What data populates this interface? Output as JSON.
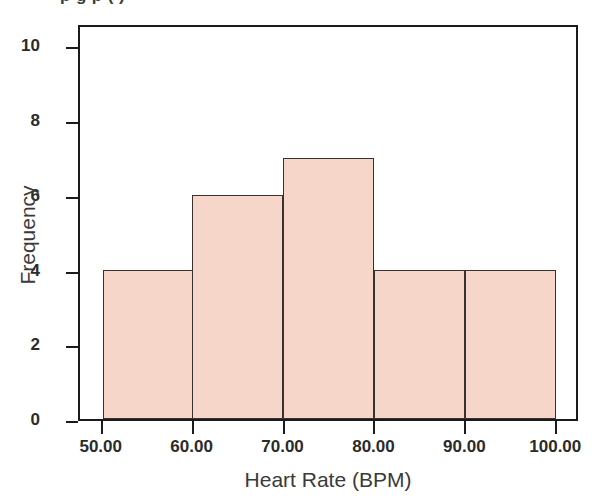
{
  "chart_data": {
    "type": "bar",
    "title": "",
    "xlabel": "Heart Rate (BPM)",
    "ylabel": "Frequency",
    "categories": [
      "50-60",
      "60-70",
      "70-80",
      "80-90",
      "90-100"
    ],
    "bin_edges": [
      50,
      60,
      70,
      80,
      90,
      100
    ],
    "values": [
      4,
      6,
      7,
      4,
      4
    ],
    "xlim": [
      47.5,
      102.5
    ],
    "ylim": [
      0,
      10.6
    ],
    "xticks": [
      50,
      60,
      70,
      80,
      90,
      100
    ],
    "xtick_labels": [
      "50.00",
      "60.00",
      "70.00",
      "80.00",
      "90.00",
      "100.00"
    ],
    "yticks": [
      0,
      2,
      4,
      6,
      8,
      10
    ],
    "ytick_labels": [
      "0",
      "2",
      "4",
      "6",
      "8",
      "10"
    ],
    "grid": false,
    "legend": null,
    "bar_fill_color": "#f6d6c9",
    "bar_edge_color": "#3a3230",
    "axis_color": "#1b1b1b",
    "background_color": "#ffffff"
  },
  "figure": {
    "cropped_title_remnant": "p g p ( )",
    "xaxis_title": "Heart Rate (BPM)",
    "yaxis_title": "Frequency"
  }
}
